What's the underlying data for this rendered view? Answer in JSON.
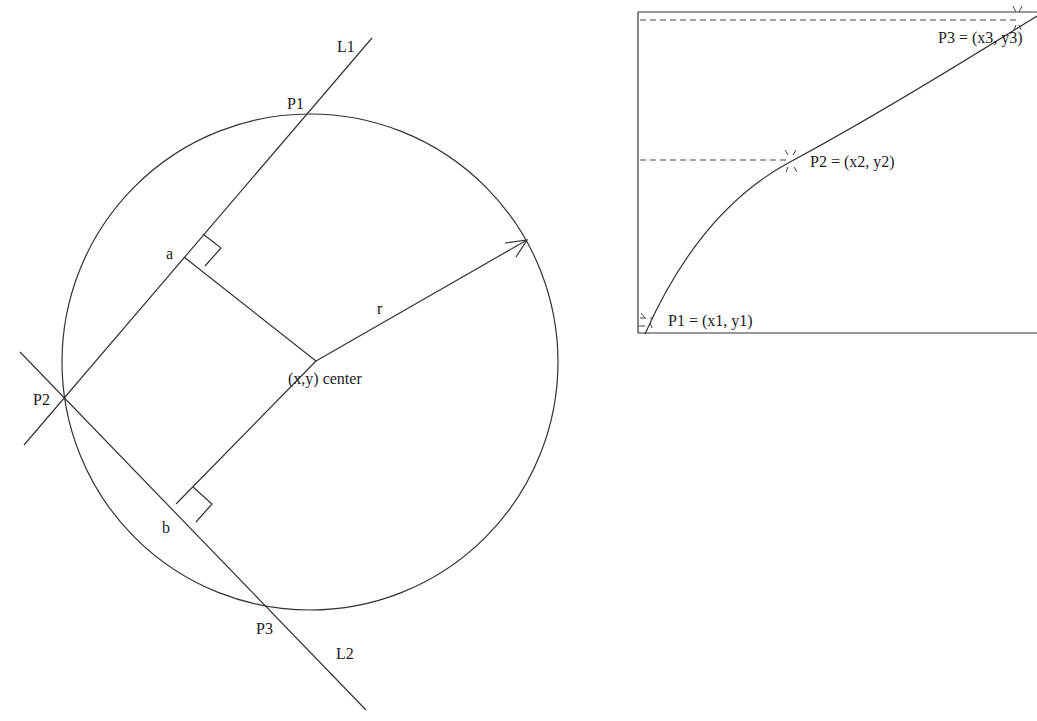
{
  "left_diagram": {
    "title": "Circle through three points",
    "labels": {
      "line1": "L1",
      "line2": "L2",
      "p1": "P1",
      "p2": "P2",
      "p3": "P3",
      "a": "a",
      "b": "b",
      "radius": "r",
      "center": "(x,y) center"
    }
  },
  "right_diagram": {
    "title": "Arc through sampled points",
    "labels": {
      "p1": "P1 = (x1, y1)",
      "p2": "P2 = (x2, y2)",
      "p3": "P3 = (x3, y3)"
    }
  },
  "colors": {
    "stroke": "#333333",
    "text": "#1a1a1a",
    "background": "#ffffff"
  }
}
